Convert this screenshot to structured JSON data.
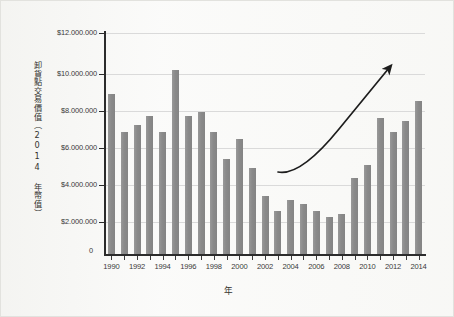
{
  "chart_data": {
    "type": "bar",
    "title": "",
    "subtitle": "",
    "xlabel": "年",
    "ylabel": "卸貨點交易價值（2014 年幣值）",
    "categories": [
      1990,
      1991,
      1992,
      1993,
      1994,
      1995,
      1996,
      1997,
      1998,
      1999,
      2000,
      2001,
      2002,
      2003,
      2004,
      2005,
      2006,
      2007,
      2008,
      2009,
      2010,
      2011,
      2012,
      2013,
      2014
    ],
    "values": [
      8700000,
      6600000,
      7000000,
      7500000,
      6600000,
      10000000,
      7500000,
      7700000,
      6600000,
      5150000,
      6250000,
      4650000,
      3150000,
      2350000,
      2950000,
      2700000,
      2350000,
      2000000,
      2150000,
      4150000,
      4850000,
      7400000,
      6600000,
      7200000,
      8300000
    ],
    "ylim": [
      0,
      12000000
    ],
    "xlim": [
      1989.5,
      2014.5
    ],
    "grid": true,
    "legend": false,
    "bar_color": "#8a8a8a",
    "gridline_color": "#dadada",
    "axis_color": "#2c2c2c",
    "y_ticks": [
      {
        "value": 0,
        "label": "0"
      },
      {
        "value": 2000000,
        "label": "$2.000.000"
      },
      {
        "value": 4000000,
        "label": "$4.000.000"
      },
      {
        "value": 6000000,
        "label": "$6.000.000"
      },
      {
        "value": 8000000,
        "label": "$8.000.000"
      },
      {
        "value": 10000000,
        "label": "$10.000.000"
      },
      {
        "value": 12000000,
        "label": "$12.000.000"
      }
    ],
    "x_tick_labels": [
      "1990",
      "1992",
      "1994",
      "1996",
      "1998",
      "2000",
      "2002",
      "2004",
      "2006",
      "2008",
      "2010",
      "2012",
      "2014"
    ],
    "annotations": [
      {
        "name": "upward-trend-arrow",
        "kind": "curved-arrow",
        "start_year": 2003,
        "end_year": 2012,
        "description": "curved arrow rising from left to right with arrowhead at upper right"
      }
    ]
  },
  "axis": {
    "y_title": "卸貨點交易價值（2014 年幣值）",
    "x_title": "年",
    "zero_label": "0"
  }
}
